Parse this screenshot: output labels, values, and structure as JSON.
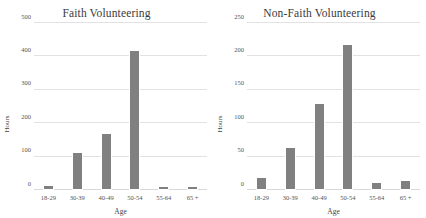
{
  "figure": {
    "background_color": "#ffffff",
    "bar_color": "#808080",
    "gridline_color": "#e2e2e2",
    "text_color": "#444444"
  },
  "chart_data": [
    {
      "type": "bar",
      "title": "Faith Volunteering",
      "xlabel": "Age",
      "ylabel": "Hours",
      "categories": [
        "18-29",
        "30-39",
        "40-49",
        "50-54",
        "55-64",
        "65 +"
      ],
      "values": [
        14,
        113,
        170,
        420,
        11,
        12
      ],
      "ylim": [
        0,
        500
      ],
      "yticks": [
        0,
        100,
        200,
        300,
        400,
        500
      ],
      "ytick_labels": [
        "0",
        "100",
        "200",
        "300",
        "400",
        "500"
      ],
      "grid": true,
      "legend": null,
      "series": [
        {
          "name": "Hours",
          "values": [
            14,
            113,
            170,
            420,
            11,
            12
          ]
        }
      ]
    },
    {
      "type": "bar",
      "title": "Non-Faith Volunteering",
      "xlabel": "Age",
      "ylabel": "Hours",
      "categories": [
        "18-29",
        "30-39",
        "40-49",
        "50-54",
        "55-64",
        "65 +"
      ],
      "values": [
        20,
        64,
        131,
        219,
        12,
        15
      ],
      "ylim": [
        0,
        250
      ],
      "yticks": [
        0,
        50,
        100,
        150,
        200,
        250
      ],
      "ytick_labels": [
        "0",
        "50",
        "100",
        "150",
        "200",
        "250"
      ],
      "grid": true,
      "legend": null,
      "series": [
        {
          "name": "Hours",
          "values": [
            20,
            64,
            131,
            219,
            12,
            15
          ]
        }
      ]
    }
  ]
}
